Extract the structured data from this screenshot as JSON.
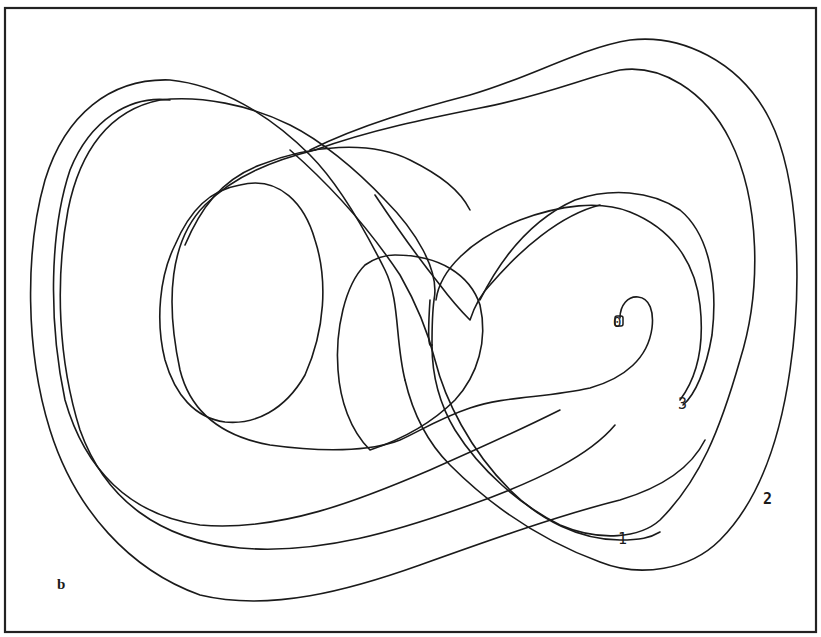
{
  "figure": {
    "panel_label": "b",
    "labels": {
      "start": "0",
      "pass_1": "1",
      "pass_2": "2",
      "pass_3": "3"
    },
    "colors": {
      "line": "#1a1a1a",
      "background": "#ffffff",
      "border": "#222222"
    }
  }
}
